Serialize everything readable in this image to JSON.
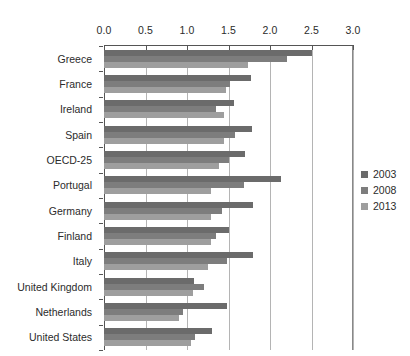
{
  "chart_data": {
    "type": "bar",
    "orientation": "horizontal",
    "title": "",
    "subtitle": "",
    "xlabel": "",
    "ylabel": "",
    "xlim": [
      0.0,
      3.0
    ],
    "xticks": [
      "0.0",
      "0.5",
      "1.0",
      "1.5",
      "2.0",
      "2.5",
      "3.0"
    ],
    "xtick_values": [
      0.0,
      0.5,
      1.0,
      1.5,
      2.0,
      2.5,
      3.0
    ],
    "grid": "vertical",
    "legend_position": "right",
    "categories": [
      "Greece",
      "France",
      "Ireland",
      "Spain",
      "OECD-25",
      "Portugal",
      "Germany",
      "Finland",
      "Italy",
      "United Kingdom",
      "Netherlands",
      "United States"
    ],
    "series": [
      {
        "name": "2003",
        "color": "#6b6b6b",
        "values": [
          2.5,
          1.77,
          1.57,
          1.78,
          1.7,
          2.13,
          1.8,
          1.5,
          1.8,
          1.08,
          1.48,
          1.3
        ]
      },
      {
        "name": "2008",
        "color": "#7d7d7d",
        "values": [
          2.2,
          1.52,
          1.35,
          1.58,
          1.5,
          1.69,
          1.42,
          1.35,
          1.48,
          1.2,
          0.95,
          1.1
        ]
      },
      {
        "name": "2013",
        "color": "#9e9e9e",
        "values": [
          1.73,
          1.47,
          1.45,
          1.44,
          1.39,
          1.29,
          1.29,
          1.29,
          1.25,
          1.07,
          0.9,
          1.05
        ]
      }
    ]
  },
  "legend": {
    "items": [
      {
        "label": "2003",
        "swatch": "s2003"
      },
      {
        "label": "2008",
        "swatch": "s2008"
      },
      {
        "label": "2013",
        "swatch": "s2013"
      }
    ]
  },
  "colors": {
    "series_2003": "#6b6b6b",
    "series_2008": "#7d7d7d",
    "series_2013": "#9e9e9e",
    "gridline": "#b4b4b4",
    "axis": "#555555",
    "text": "#2b2b2b",
    "background": "#ffffff"
  }
}
